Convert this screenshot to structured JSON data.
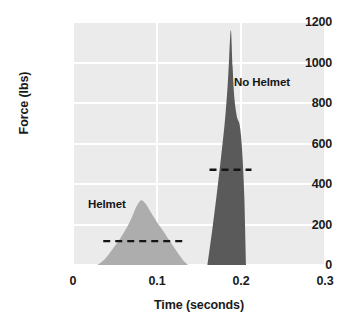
{
  "chart_data": {
    "type": "area",
    "title": "",
    "subtitle": "",
    "xlabel": "Time (seconds)",
    "ylabel": "Force (lbs)",
    "xlim": [
      0,
      0.3
    ],
    "ylim": [
      0,
      1200
    ],
    "xticks": [
      "0",
      "0.1",
      "0.2",
      "0.3"
    ],
    "xtick_values": [
      0,
      0.1,
      0.2,
      0.3
    ],
    "yticks": [
      "0",
      "200",
      "400",
      "600",
      "800",
      "1000",
      "1200"
    ],
    "ytick_values": [
      0,
      200,
      400,
      600,
      800,
      1000,
      1200
    ],
    "grid": true,
    "grid_color": "#ffffff",
    "plot_background": "#ebebeb",
    "legend_position": "inline-annotation",
    "series": [
      {
        "name": "Helmet",
        "color": "#adadad",
        "peak_force": 320,
        "peak_time": 0.081,
        "start_time": 0.029,
        "end_time": 0.137,
        "mean_line_value": 118,
        "mean_line_start": 0.036,
        "mean_line_end": 0.136,
        "x": [
          0.029,
          0.035,
          0.041,
          0.047,
          0.053,
          0.059,
          0.065,
          0.071,
          0.076,
          0.081,
          0.086,
          0.091,
          0.096,
          0.101,
          0.107,
          0.113,
          0.119,
          0.125,
          0.131,
          0.137
        ],
        "values": [
          0,
          18,
          45,
          78,
          112,
          150,
          192,
          245,
          292,
          320,
          305,
          272,
          238,
          205,
          170,
          132,
          95,
          58,
          24,
          0
        ]
      },
      {
        "name": "No Helmet",
        "color": "#5a5a5a",
        "peak_force": 1160,
        "peak_time": 0.188,
        "start_time": 0.16,
        "end_time": 0.206,
        "mean_line_value": 470,
        "mean_line_start": 0.1625,
        "mean_line_end": 0.2125,
        "x": [
          0.16,
          0.166,
          0.172,
          0.177,
          0.181,
          0.184,
          0.186,
          0.188,
          0.19,
          0.192,
          0.195,
          0.198,
          0.2,
          0.202,
          0.204,
          0.206
        ],
        "values": [
          0,
          180,
          380,
          560,
          720,
          880,
          1030,
          1160,
          980,
          830,
          735,
          700,
          640,
          520,
          330,
          0
        ]
      }
    ],
    "annotations": [
      {
        "text": "Helmet",
        "time": 0.048,
        "force": 400
      },
      {
        "text": "No Helmet",
        "time": 0.222,
        "force": 880
      }
    ]
  },
  "axes": {
    "y_title": "Force (lbs)",
    "x_title": "Time (seconds)",
    "y_ticks": [
      "1200",
      "1000",
      "800",
      "600",
      "400",
      "200",
      "0"
    ],
    "x_ticks": [
      "0",
      "0.1",
      "0.2",
      "0.3"
    ]
  },
  "labels": {
    "helmet": "Helmet",
    "no_helmet": "No Helmet"
  },
  "colors": {
    "helmet_fill": "#adadad",
    "no_helmet_fill": "#5a5a5a",
    "mean_line": "#141414",
    "plot_background": "#ebebeb",
    "grid": "#ffffff",
    "text": "#1a1a1a"
  }
}
